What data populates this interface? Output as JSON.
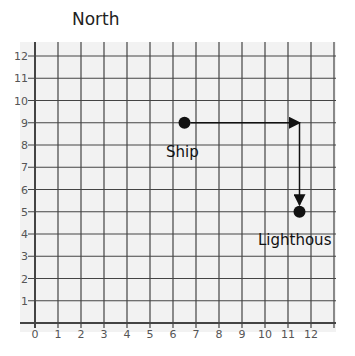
{
  "title": "North",
  "chart_data": {
    "type": "scatter",
    "title": "North",
    "xlabel": "",
    "ylabel": "",
    "xlim": [
      0,
      13
    ],
    "ylim": [
      0,
      13
    ],
    "x_ticks": [
      "0",
      "1",
      "2",
      "3",
      "4",
      "5",
      "6",
      "7",
      "8",
      "9",
      "10",
      "11",
      "12"
    ],
    "y_ticks": [
      "1",
      "2",
      "3",
      "4",
      "5",
      "6",
      "7",
      "8",
      "9",
      "10",
      "11",
      "12"
    ],
    "grid": true,
    "points": [
      {
        "label": "Ship",
        "x": 6.5,
        "y": 9
      },
      {
        "label": "Lighthous",
        "x": 11.5,
        "y": 5
      }
    ],
    "arrows": [
      {
        "from": [
          6.5,
          9
        ],
        "to": [
          11.5,
          9
        ]
      },
      {
        "from": [
          11.5,
          9
        ],
        "to": [
          11.5,
          5
        ]
      }
    ]
  },
  "labels": {
    "ship": "Ship",
    "lighthouse": "Lighthous"
  }
}
